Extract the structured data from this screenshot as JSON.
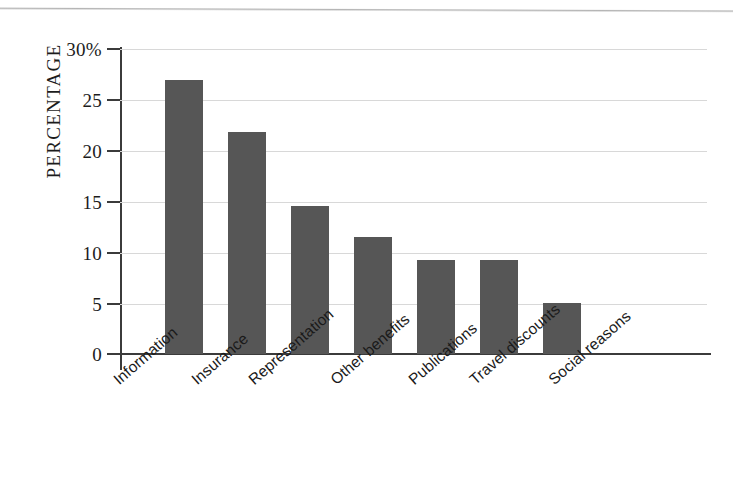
{
  "chart_data": {
    "type": "bar",
    "title": "",
    "subtitle": "",
    "xlabel": "",
    "ylabel": "PERCENTAGE",
    "categories": [
      "Information",
      "Insurance",
      "Representation",
      "Other benefits",
      "Publications",
      "Travel discounts",
      "Social reasons"
    ],
    "values": [
      27.0,
      21.8,
      14.6,
      11.5,
      9.2,
      9.2,
      5.0
    ],
    "ylim": [
      0,
      30
    ],
    "ytick_values": [
      0,
      5,
      10,
      15,
      20,
      25,
      30
    ],
    "ytick_labels": [
      "0",
      "5",
      "10",
      "15",
      "20",
      "25",
      "30%"
    ],
    "grid": true,
    "legend": "none",
    "bar_color": "#565656",
    "grid_color": "#d8d8d8",
    "axis_color": "#3b3b3b"
  },
  "axis": {
    "y_title": "PERCENTAGE"
  }
}
